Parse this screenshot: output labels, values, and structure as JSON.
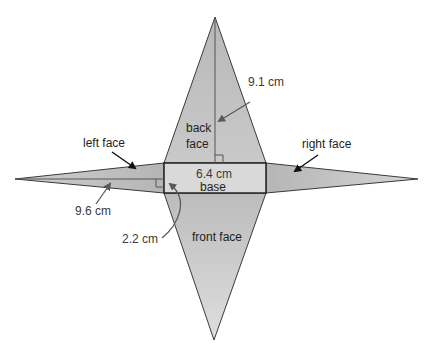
{
  "diagram": {
    "type": "net of square-based pyramid",
    "faces": {
      "back": {
        "label_line1": "back",
        "label_line2": "face"
      },
      "front": {
        "label": "front face"
      },
      "left": {
        "label": "left face"
      },
      "right": {
        "label": "right face"
      },
      "base": {
        "label": "base"
      }
    },
    "measurements": {
      "back_height": "9.1 cm",
      "base_length": "6.4 cm",
      "left_height": "9.6 cm",
      "base_width": "2.2 cm"
    },
    "colors": {
      "face_fill": "#bdbdbd",
      "face_fill_light": "#d8d8d8",
      "base_fill": "#dcdcdc",
      "stroke": "#333333",
      "arrow": "#5a5a5a"
    }
  }
}
